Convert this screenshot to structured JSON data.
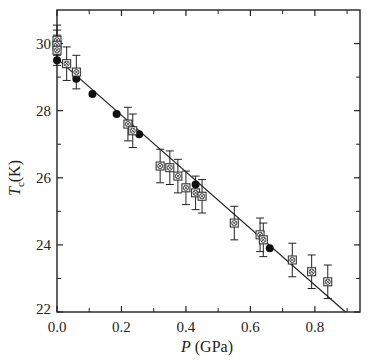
{
  "chart_data": {
    "type": "scatter",
    "title": "",
    "xlabel": "P (GPa)",
    "xlabel_var": "P",
    "xlabel_unit": "(GPa)",
    "ylabel": "Tc (K)",
    "ylabel_var": "T",
    "ylabel_sub": "c",
    "ylabel_unit": "(K)",
    "xlim": [
      0.0,
      0.94
    ],
    "ylim": [
      22,
      31
    ],
    "x_ticks": [
      0.0,
      0.2,
      0.4,
      0.6,
      0.8
    ],
    "x_tick_labels": [
      "0.0",
      "0.2",
      "0.4",
      "0.6",
      "0.8"
    ],
    "x_minor_ticks": [
      0.1,
      0.3,
      0.5,
      0.7,
      0.9
    ],
    "y_ticks": [
      22,
      24,
      26,
      28,
      30
    ],
    "y_tick_labels": [
      "22",
      "24",
      "26",
      "28",
      "30"
    ],
    "y_minor_ticks": [
      23,
      25,
      27,
      29
    ],
    "grid": false,
    "legend": null,
    "series": [
      {
        "name": "filled circles",
        "marker": "filled-circle",
        "points": [
          {
            "x": 0.0,
            "y": 29.5
          },
          {
            "x": 0.06,
            "y": 28.95
          },
          {
            "x": 0.11,
            "y": 28.5
          },
          {
            "x": 0.185,
            "y": 27.9
          },
          {
            "x": 0.255,
            "y": 27.3
          },
          {
            "x": 0.43,
            "y": 25.8
          },
          {
            "x": 0.66,
            "y": 23.9
          }
        ]
      },
      {
        "name": "open squares with cross",
        "marker": "crossed-square",
        "points": [
          {
            "x": 0.0,
            "y": 30.1,
            "err": 0.45
          },
          {
            "x": 0.0,
            "y": 29.95,
            "err": 0.45
          },
          {
            "x": 0.0,
            "y": 29.8,
            "err": 0.45
          },
          {
            "x": 0.03,
            "y": 29.4,
            "err": 0.5
          },
          {
            "x": 0.06,
            "y": 29.15,
            "err": 0.5
          },
          {
            "x": 0.22,
            "y": 27.6,
            "err": 0.5
          },
          {
            "x": 0.235,
            "y": 27.4,
            "err": 0.5
          },
          {
            "x": 0.32,
            "y": 26.35,
            "err": 0.5
          },
          {
            "x": 0.35,
            "y": 26.3,
            "err": 0.5
          },
          {
            "x": 0.375,
            "y": 26.05,
            "err": 0.5
          },
          {
            "x": 0.4,
            "y": 25.7,
            "err": 0.5
          },
          {
            "x": 0.43,
            "y": 25.55,
            "err": 0.5
          },
          {
            "x": 0.45,
            "y": 25.45,
            "err": 0.5
          },
          {
            "x": 0.55,
            "y": 24.65,
            "err": 0.5
          },
          {
            "x": 0.63,
            "y": 24.3,
            "err": 0.5
          },
          {
            "x": 0.64,
            "y": 24.15,
            "err": 0.5
          },
          {
            "x": 0.73,
            "y": 23.55,
            "err": 0.5
          },
          {
            "x": 0.79,
            "y": 23.2,
            "err": 0.5
          },
          {
            "x": 0.84,
            "y": 22.9,
            "err": 0.5
          }
        ]
      }
    ],
    "fit_line": {
      "x": [
        0.0,
        0.895
      ],
      "y": [
        29.55,
        22.0
      ],
      "slope": -8.4
    }
  }
}
